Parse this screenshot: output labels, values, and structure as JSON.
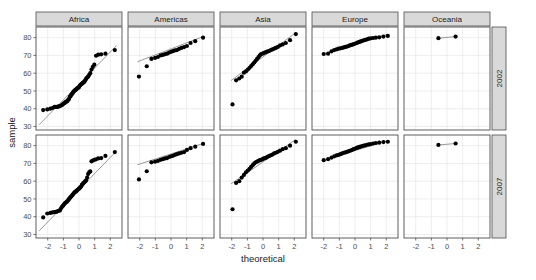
{
  "figure": {
    "kind": "qq-plot-facet-grid",
    "panel_fill": "#ffffff",
    "panel_border": "#4d4d4d",
    "grid_color": "#e6e6e6",
    "strip_fill": "#d9d9d9",
    "strip_border": "#4d4d4d",
    "point_color": "#000000",
    "line_color": "#7f7f7f",
    "background": "#ffffff"
  },
  "axes": {
    "xlabel": "theoretical",
    "ylabel": "sample",
    "x_ticks": [
      "-2",
      "-1",
      "0",
      "1",
      "2"
    ],
    "x_tick_values": [
      -2,
      -1,
      0,
      1,
      2
    ],
    "y_ticks": [
      "30",
      "40",
      "50",
      "60",
      "70",
      "80"
    ],
    "y_tick_values": [
      30,
      40,
      50,
      60,
      70,
      80
    ],
    "xlim": [
      -2.75,
      2.75
    ],
    "ylim": [
      28,
      86
    ]
  },
  "facets": {
    "columns": [
      "Africa",
      "Americas",
      "Asia",
      "Europe",
      "Oceania"
    ],
    "rows": [
      "2002",
      "2007"
    ]
  },
  "chart_data": {
    "type": "scatter",
    "title": "",
    "subtitle": "",
    "xlabel": "theoretical",
    "ylabel": "sample",
    "xlim": [
      -2.75,
      2.75
    ],
    "ylim": [
      28,
      86
    ],
    "grid": true,
    "legend": "none",
    "facet_columns": [
      "Africa",
      "Americas",
      "Asia",
      "Europe",
      "Oceania"
    ],
    "facet_rows": [
      "2002",
      "2007"
    ],
    "qq_reference_lines": [
      {
        "facet": "Africa|2002",
        "x1": -2.55,
        "y1": 31.0,
        "x2": 2.4,
        "y2": 75.5
      },
      {
        "facet": "Americas|2002",
        "x1": -2.15,
        "y1": 66.4,
        "x2": 2.05,
        "y2": 80.6
      },
      {
        "facet": "Asia|2002",
        "x1": -2.05,
        "y1": 55.8,
        "x2": 2.1,
        "y2": 82.8
      },
      {
        "facet": "Europe|2002",
        "x1": -2.05,
        "y1": 70.6,
        "x2": 2.1,
        "y2": 81.9
      },
      {
        "facet": "Oceania|2002",
        "x1": -0.55,
        "y1": 79.7,
        "x2": 0.55,
        "y2": 80.6
      },
      {
        "facet": "Africa|2007",
        "x1": -2.55,
        "y1": 32.0,
        "x2": 2.4,
        "y2": 77.0
      },
      {
        "facet": "Americas|2007",
        "x1": -2.15,
        "y1": 69.2,
        "x2": 2.05,
        "y2": 81.2
      },
      {
        "facet": "Asia|2007",
        "x1": -2.05,
        "y1": 58.5,
        "x2": 2.1,
        "y2": 83.5
      },
      {
        "facet": "Europe|2007",
        "x1": -2.05,
        "y1": 71.8,
        "x2": 2.1,
        "y2": 82.8
      },
      {
        "facet": "Oceania|2007",
        "x1": -0.55,
        "y1": 80.4,
        "x2": 0.55,
        "y2": 81.2
      }
    ],
    "series": [
      {
        "name": "Africa|2002",
        "facet_col": "Africa",
        "facet_row": "2002",
        "n": 52,
        "theoretical": [
          -2.29,
          -2.03,
          -1.83,
          -1.69,
          -1.57,
          -1.47,
          -1.38,
          -1.3,
          -1.22,
          -1.15,
          -1.08,
          -1.02,
          -0.96,
          -0.9,
          -0.85,
          -0.79,
          -0.74,
          -0.69,
          -0.64,
          -0.59,
          -0.54,
          -0.49,
          -0.44,
          -0.39,
          -0.35,
          -0.3,
          -0.25,
          -0.2,
          -0.16,
          -0.11,
          -0.06,
          -0.01,
          0.04,
          0.09,
          0.14,
          0.19,
          0.24,
          0.29,
          0.35,
          0.4,
          0.46,
          0.52,
          0.58,
          0.65,
          0.72,
          0.8,
          0.88,
          0.98,
          1.09,
          1.23,
          1.42,
          1.69,
          2.29
        ],
        "sample": [
          39.2,
          39.6,
          40.0,
          40.4,
          41.0,
          41.0,
          41.0,
          41.3,
          41.5,
          41.8,
          42.1,
          42.6,
          43.0,
          43.3,
          43.8,
          44.0,
          44.3,
          45.0,
          45.5,
          46.6,
          47.0,
          48.0,
          48.3,
          49.0,
          49.6,
          50.0,
          50.4,
          50.7,
          51.0,
          51.5,
          51.8,
          52.0,
          52.9,
          53.3,
          53.7,
          54.1,
          54.4,
          54.8,
          55.2,
          56.0,
          56.9,
          57.5,
          58.0,
          59.0,
          60.0,
          62.0,
          63.5,
          64.8,
          69.8,
          70.4,
          70.6,
          71.0,
          73.0,
          73.9,
          75.7
        ]
      },
      {
        "name": "Americas|2002",
        "facet_col": "Americas",
        "facet_row": "2002",
        "n": 25,
        "theoretical": [
          -2.05,
          -1.55,
          -1.25,
          -1.02,
          -0.84,
          -0.67,
          -0.52,
          -0.38,
          -0.25,
          -0.12,
          0.0,
          0.12,
          0.25,
          0.38,
          0.52,
          0.67,
          0.84,
          1.02,
          1.25,
          1.55,
          2.05
        ],
        "sample": [
          58.1,
          63.9,
          68.0,
          68.6,
          69.1,
          70.0,
          70.3,
          70.7,
          71.0,
          71.6,
          72.0,
          72.4,
          72.8,
          73.0,
          73.7,
          74.2,
          74.7,
          75.3,
          77.0,
          78.0,
          80.0
        ]
      },
      {
        "name": "Asia|2002",
        "facet_col": "Asia",
        "facet_row": "2002",
        "n": 33,
        "theoretical": [
          -1.95,
          -1.72,
          -1.52,
          -1.36,
          -1.22,
          -1.09,
          -0.97,
          -0.86,
          -0.76,
          -0.66,
          -0.56,
          -0.47,
          -0.38,
          -0.29,
          -0.2,
          -0.12,
          -0.03,
          0.05,
          0.14,
          0.23,
          0.32,
          0.41,
          0.5,
          0.6,
          0.71,
          0.82,
          0.95,
          1.09,
          1.26,
          1.46,
          1.73,
          2.1
        ],
        "sample": [
          42.4,
          56.0,
          57.0,
          58.0,
          60.3,
          61.0,
          62.0,
          63.0,
          64.0,
          65.0,
          66.0,
          67.0,
          68.0,
          69.0,
          70.0,
          70.8,
          71.0,
          71.3,
          71.7,
          72.0,
          72.3,
          72.6,
          73.0,
          73.4,
          73.8,
          74.2,
          74.8,
          75.6,
          76.2,
          77.0,
          78.6,
          82.0,
          82.6
        ]
      },
      {
        "name": "Europe|2002",
        "facet_col": "Europe",
        "facet_row": "2002",
        "n": 30,
        "theoretical": [
          -2.0,
          -1.72,
          -1.5,
          -1.33,
          -1.18,
          -1.05,
          -0.93,
          -0.82,
          -0.71,
          -0.61,
          -0.51,
          -0.42,
          -0.33,
          -0.24,
          -0.15,
          -0.07,
          0.02,
          0.11,
          0.19,
          0.28,
          0.37,
          0.46,
          0.56,
          0.66,
          0.77,
          0.88,
          1.01,
          1.16,
          1.33,
          1.55,
          1.82,
          2.1
        ],
        "sample": [
          70.8,
          71.0,
          72.3,
          73.0,
          73.4,
          73.8,
          74.0,
          74.2,
          74.5,
          74.8,
          75.0,
          75.3,
          75.6,
          75.9,
          76.1,
          76.4,
          76.7,
          77.0,
          77.3,
          77.6,
          77.9,
          78.2,
          78.5,
          78.8,
          79.0,
          79.4,
          79.6,
          79.8,
          80.0,
          80.2,
          80.6,
          81.0
        ]
      },
      {
        "name": "Oceania|2002",
        "facet_col": "Oceania",
        "facet_row": "2002",
        "n": 2,
        "theoretical": [
          -0.55,
          0.55
        ],
        "sample": [
          79.7,
          80.6
        ]
      },
      {
        "name": "Africa|2007",
        "facet_col": "Africa",
        "facet_row": "2007",
        "n": 52,
        "theoretical": [
          -2.29,
          -2.03,
          -1.83,
          -1.69,
          -1.57,
          -1.47,
          -1.38,
          -1.3,
          -1.22,
          -1.15,
          -1.08,
          -1.02,
          -0.96,
          -0.9,
          -0.85,
          -0.79,
          -0.74,
          -0.69,
          -0.64,
          -0.59,
          -0.54,
          -0.49,
          -0.44,
          -0.39,
          -0.35,
          -0.3,
          -0.25,
          -0.2,
          -0.16,
          -0.11,
          -0.06,
          -0.01,
          0.04,
          0.09,
          0.14,
          0.19,
          0.24,
          0.29,
          0.35,
          0.4,
          0.46,
          0.52,
          0.58,
          0.65,
          0.72,
          0.8,
          0.88,
          0.98,
          1.09,
          1.23,
          1.42,
          1.69,
          2.29
        ],
        "sample": [
          39.6,
          41.8,
          42.1,
          42.4,
          42.6,
          42.7,
          43.0,
          43.3,
          43.5,
          44.7,
          45.7,
          46.2,
          46.9,
          47.5,
          48.0,
          48.3,
          48.8,
          49.3,
          50.0,
          50.4,
          51.0,
          51.5,
          52.0,
          52.5,
          53.0,
          53.5,
          54.0,
          54.1,
          54.5,
          55.0,
          55.3,
          55.8,
          56.0,
          56.7,
          57.0,
          58.0,
          58.4,
          59.0,
          59.4,
          60.0,
          60.4,
          62.0,
          64.0,
          65.0,
          65.5,
          71.2,
          71.6,
          72.0,
          72.3,
          72.8,
          73.0,
          74.2,
          76.4
        ]
      },
      {
        "name": "Americas|2007",
        "facet_col": "Americas",
        "facet_row": "2007",
        "n": 25,
        "theoretical": [
          -2.05,
          -1.55,
          -1.25,
          -1.02,
          -0.84,
          -0.67,
          -0.52,
          -0.38,
          -0.25,
          -0.12,
          0.0,
          0.12,
          0.25,
          0.38,
          0.52,
          0.67,
          0.84,
          1.02,
          1.25,
          1.55,
          2.05
        ],
        "sample": [
          61.0,
          65.6,
          70.6,
          71.0,
          71.4,
          72.0,
          72.4,
          72.8,
          73.0,
          73.6,
          74.0,
          74.3,
          74.8,
          75.2,
          75.6,
          76.0,
          76.4,
          77.6,
          78.6,
          79.4,
          81.0
        ]
      },
      {
        "name": "Asia|2007",
        "facet_col": "Asia",
        "facet_row": "2007",
        "n": 33,
        "theoretical": [
          -1.95,
          -1.72,
          -1.52,
          -1.36,
          -1.22,
          -1.09,
          -0.97,
          -0.86,
          -0.76,
          -0.66,
          -0.56,
          -0.47,
          -0.38,
          -0.29,
          -0.2,
          -0.12,
          -0.03,
          0.05,
          0.14,
          0.23,
          0.32,
          0.41,
          0.5,
          0.6,
          0.71,
          0.82,
          0.95,
          1.09,
          1.26,
          1.46,
          1.73,
          2.1
        ],
        "sample": [
          44.2,
          59.0,
          60.0,
          62.0,
          63.5,
          65.0,
          66.0,
          67.0,
          68.0,
          69.0,
          70.0,
          70.6,
          71.0,
          71.4,
          71.8,
          72.0,
          72.4,
          72.8,
          73.0,
          73.4,
          73.9,
          74.2,
          74.6,
          75.0,
          75.6,
          76.0,
          76.5,
          77.2,
          78.0,
          78.6,
          80.0,
          82.2,
          82.6
        ]
      },
      {
        "name": "Europe|2007",
        "facet_col": "Europe",
        "facet_row": "2007",
        "n": 30,
        "theoretical": [
          -2.0,
          -1.72,
          -1.5,
          -1.33,
          -1.18,
          -1.05,
          -0.93,
          -0.82,
          -0.71,
          -0.61,
          -0.51,
          -0.42,
          -0.33,
          -0.24,
          -0.15,
          -0.07,
          0.02,
          0.11,
          0.19,
          0.28,
          0.37,
          0.46,
          0.56,
          0.66,
          0.77,
          0.88,
          1.01,
          1.16,
          1.33,
          1.55,
          1.82,
          2.1
        ],
        "sample": [
          71.8,
          72.4,
          73.3,
          74.0,
          74.5,
          74.8,
          75.2,
          75.6,
          76.0,
          76.2,
          76.5,
          76.8,
          77.1,
          77.4,
          77.8,
          78.1,
          78.4,
          78.7,
          79.0,
          79.3,
          79.5,
          79.8,
          80.0,
          80.2,
          80.5,
          80.7,
          80.9,
          81.2,
          81.5,
          81.7,
          82.0,
          82.2
        ]
      },
      {
        "name": "Oceania|2007",
        "facet_col": "Oceania",
        "facet_row": "2007",
        "n": 2,
        "theoretical": [
          -0.55,
          0.55
        ],
        "sample": [
          80.4,
          81.2
        ]
      }
    ]
  }
}
